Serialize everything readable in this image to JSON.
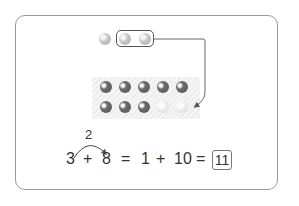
{
  "diagram": {
    "top_beads": {
      "count": 3,
      "grouped_count": 2,
      "colors": {
        "bead": "#bdbdbd"
      }
    },
    "ten_frame": {
      "filled": 8,
      "empty": 2,
      "rows": 2,
      "cols": 5,
      "colors": {
        "filled": "#5e5e5e",
        "empty": "#e4e4e4"
      }
    },
    "arc_label": "2",
    "equation": {
      "a": "3",
      "plus1": "+",
      "b": "8",
      "eq1": "=",
      "c": "1",
      "plus2": "+",
      "d": "10",
      "eq2": "=",
      "answer": "11"
    }
  }
}
